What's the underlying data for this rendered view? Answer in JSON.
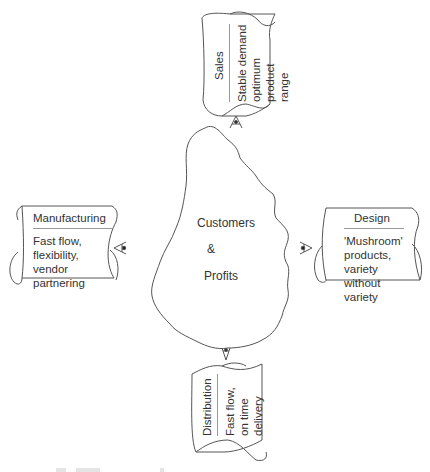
{
  "diagram": {
    "center": {
      "lines": [
        "Customers",
        "&",
        "Profits"
      ]
    },
    "scrolls": {
      "sales": {
        "title": "Sales",
        "lines": [
          "Stable demand",
          "optimum",
          "product",
          "range"
        ],
        "orientation": "rotated-left",
        "position": "top"
      },
      "manufacturing": {
        "title": "Manufacturing",
        "lines": [
          "Fast flow,",
          "flexibility,",
          "vendor",
          "partnering"
        ],
        "position": "left"
      },
      "design": {
        "title": "Design",
        "lines": [
          "'Mushroom'",
          "products,",
          "variety",
          "without",
          "variety"
        ],
        "position": "right"
      },
      "distribution": {
        "title": "Distribution",
        "lines": [
          "Fast flow,",
          "on time",
          "delivery"
        ],
        "orientation": "rotated-left",
        "position": "bottom"
      }
    },
    "eye_icons": [
      "top",
      "left",
      "right",
      "bottom"
    ],
    "colors": {
      "stroke": "#555555",
      "text": "#333333",
      "background": "#ffffff"
    }
  }
}
